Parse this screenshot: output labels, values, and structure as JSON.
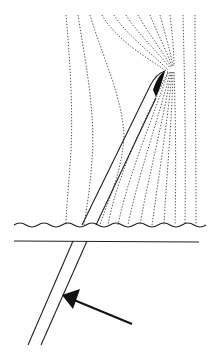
{
  "diagram": {
    "colors": {
      "line": "#222222",
      "field_line": "#444444",
      "background": "#ffffff"
    },
    "elements": {
      "field_lines": "dashed-curves",
      "needle_upper": "needle-shaft-above-surface",
      "needle_tip": "beveled-tip",
      "surface": "wavy-surface-line",
      "baseline": "horizontal-boundary-line",
      "needle_lower": "needle-shaft-below-boundary",
      "arrow": "insertion-direction-arrow"
    }
  }
}
